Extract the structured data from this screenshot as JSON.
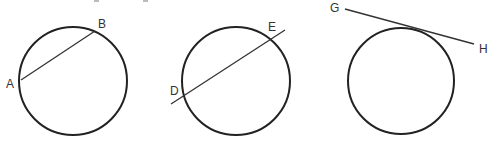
{
  "figures": [
    {
      "name": "chord",
      "circle": {
        "cx": 73,
        "cy": 81,
        "r": 54
      },
      "segment": {
        "x1": 21,
        "y1": 80,
        "x2": 95,
        "y2": 31
      },
      "labels": [
        {
          "text": "A",
          "x": 6,
          "y": 88
        },
        {
          "text": "B",
          "x": 98,
          "y": 28
        }
      ]
    },
    {
      "name": "secant",
      "circle": {
        "cx": 236,
        "cy": 81,
        "r": 54
      },
      "segment": {
        "x1": 171,
        "y1": 104,
        "x2": 285,
        "y2": 30
      },
      "labels": [
        {
          "text": "D",
          "x": 170,
          "y": 95
        },
        {
          "text": "E",
          "x": 268,
          "y": 31
        }
      ]
    },
    {
      "name": "tangent",
      "circle": {
        "cx": 401,
        "cy": 81,
        "r": 53
      },
      "segment": {
        "x1": 345,
        "y1": 9,
        "x2": 474,
        "y2": 44
      },
      "labels": [
        {
          "text": "G",
          "x": 330,
          "y": 12
        },
        {
          "text": "H",
          "x": 479,
          "y": 53
        }
      ]
    }
  ],
  "colors": {
    "stroke": "#222222",
    "text": "#333333"
  }
}
